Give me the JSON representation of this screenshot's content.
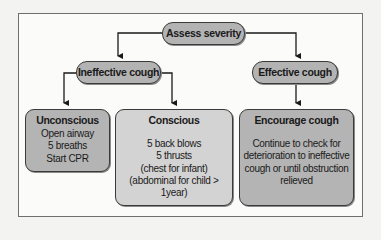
{
  "diagram": {
    "root": {
      "label": "Assess severity"
    },
    "branches": [
      {
        "label": "Ineffective cough"
      },
      {
        "label": "Effective cough"
      }
    ],
    "leaves": [
      {
        "title": "Unconscious",
        "lines": [
          "Open airway",
          "5 breaths",
          "Start CPR"
        ]
      },
      {
        "title": "Conscious",
        "lines": [
          "5 back blows",
          "5 thrusts",
          "(chest for infant)",
          "(abdominal for child > 1year)"
        ]
      },
      {
        "title": "Encourage cough",
        "lines": [
          "Continue to check for",
          "deterioration to ineffective",
          "cough or until obstruction",
          "relieved"
        ]
      }
    ],
    "colors": {
      "node_fill": "#b3b3b3",
      "conscious_fill": "#d3d3d3",
      "stroke": "#1a1a1a",
      "frame": "#6f6f6f"
    }
  }
}
